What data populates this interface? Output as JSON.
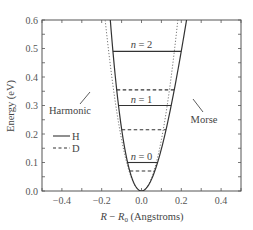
{
  "chart_data": {
    "type": "line",
    "title": "",
    "xlabel": "R − R0 (Angstroms)",
    "xlabel_parts": {
      "var": "R",
      "minus": " − ",
      "var2": "R",
      "sub": "0",
      "unit": " (Angstroms)"
    },
    "ylabel": "Energy (eV)",
    "xlim": [
      -0.5,
      0.5
    ],
    "ylim": [
      0.0,
      0.6
    ],
    "xticks": [
      -0.4,
      -0.2,
      0.0,
      0.2,
      0.4
    ],
    "xtick_labels": [
      "−0.4",
      "−0.2",
      "0.0",
      "0.2",
      "0.4"
    ],
    "yticks": [
      0.0,
      0.1,
      0.2,
      0.3,
      0.4,
      0.5,
      0.6
    ],
    "ytick_labels": [
      "0.0",
      "0.1",
      "0.2",
      "0.3",
      "0.4",
      "0.5",
      "0.6"
    ],
    "grid": false,
    "series": [
      {
        "name": "Morse",
        "style": "solid",
        "De": 4.75,
        "a": 1.94
      },
      {
        "name": "Harmonic",
        "style": "dotted",
        "k": 36.0
      }
    ],
    "levels": [
      {
        "isotope": "H",
        "n": 0,
        "energy": 0.1,
        "style": "solid",
        "label": "n = 0"
      },
      {
        "isotope": "H",
        "n": 1,
        "energy": 0.3,
        "style": "solid",
        "label": "n = 1"
      },
      {
        "isotope": "H",
        "n": 2,
        "energy": 0.49,
        "style": "solid",
        "label": "n = 2"
      },
      {
        "isotope": "D",
        "n": 0,
        "energy": 0.07,
        "style": "dashed"
      },
      {
        "isotope": "D",
        "n": 1,
        "energy": 0.215,
        "style": "dashed"
      },
      {
        "isotope": "D",
        "n": 2,
        "energy": 0.355,
        "style": "dashed"
      }
    ],
    "legend": {
      "placement": "left-middle",
      "entries": [
        {
          "label": "H",
          "style": "solid"
        },
        {
          "label": "D",
          "style": "dashed"
        }
      ]
    },
    "annotations": [
      {
        "text": "Harmonic",
        "points_to": "Harmonic"
      },
      {
        "text": "Morse",
        "points_to": "Morse"
      }
    ]
  }
}
